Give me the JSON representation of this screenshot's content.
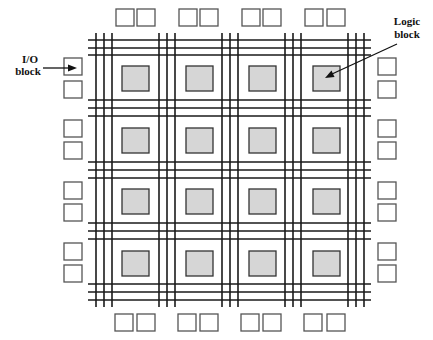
{
  "diagram": {
    "type": "fpga-architecture",
    "labels": {
      "io_block_line1": "I/O",
      "io_block_line2": "block",
      "logic_block_line1": "Logic",
      "logic_block_line2": "block"
    },
    "grid": {
      "logic_block_rows": 4,
      "logic_block_cols": 4,
      "routing_tracks_per_channel": 3,
      "horizontal_channel_y": [
        [
          40,
          48,
          55
        ],
        [
          100,
          108,
          116
        ],
        [
          162,
          170,
          178
        ],
        [
          223,
          231,
          239
        ],
        [
          284,
          292,
          300
        ]
      ],
      "vertical_channel_x": [
        [
          96,
          104,
          112
        ],
        [
          159,
          167,
          175
        ],
        [
          222,
          230,
          238
        ],
        [
          285,
          293,
          301
        ],
        [
          348,
          356,
          364
        ]
      ],
      "horizontal_line_extent": [
        88,
        371
      ],
      "vertical_line_extent": [
        33,
        307
      ],
      "logic_block_col_x": [
        122,
        186,
        249,
        313
      ],
      "logic_block_row_y": [
        66,
        128,
        189,
        251
      ],
      "logic_block_size": [
        27,
        25
      ]
    },
    "io_blocks": {
      "top": [
        {
          "x": 116,
          "y": 9
        },
        {
          "x": 137,
          "y": 9
        },
        {
          "x": 179,
          "y": 9
        },
        {
          "x": 200,
          "y": 9
        },
        {
          "x": 242,
          "y": 9
        },
        {
          "x": 263,
          "y": 9
        },
        {
          "x": 305,
          "y": 9
        },
        {
          "x": 327,
          "y": 9
        }
      ],
      "bottom": [
        {
          "x": 115,
          "y": 314
        },
        {
          "x": 137,
          "y": 314
        },
        {
          "x": 178,
          "y": 314
        },
        {
          "x": 200,
          "y": 314
        },
        {
          "x": 241,
          "y": 314
        },
        {
          "x": 263,
          "y": 314
        },
        {
          "x": 304,
          "y": 314
        },
        {
          "x": 327,
          "y": 314
        }
      ],
      "left": [
        {
          "x": 64,
          "y": 58
        },
        {
          "x": 64,
          "y": 81
        },
        {
          "x": 64,
          "y": 120
        },
        {
          "x": 64,
          "y": 142
        },
        {
          "x": 64,
          "y": 182
        },
        {
          "x": 64,
          "y": 204
        },
        {
          "x": 64,
          "y": 243
        },
        {
          "x": 64,
          "y": 265
        }
      ],
      "right": [
        {
          "x": 378,
          "y": 58
        },
        {
          "x": 378,
          "y": 81
        },
        {
          "x": 378,
          "y": 120
        },
        {
          "x": 378,
          "y": 142
        },
        {
          "x": 378,
          "y": 182
        },
        {
          "x": 378,
          "y": 204
        },
        {
          "x": 378,
          "y": 243
        },
        {
          "x": 378,
          "y": 265
        }
      ],
      "size": [
        18,
        17
      ]
    },
    "colors": {
      "routing_line": "#1a1a1a",
      "logic_block_fill": "#d6d6d6",
      "logic_block_stroke": "#333333",
      "io_block_fill": "#ffffff",
      "io_block_stroke": "#555555",
      "background": "#ffffff"
    }
  }
}
